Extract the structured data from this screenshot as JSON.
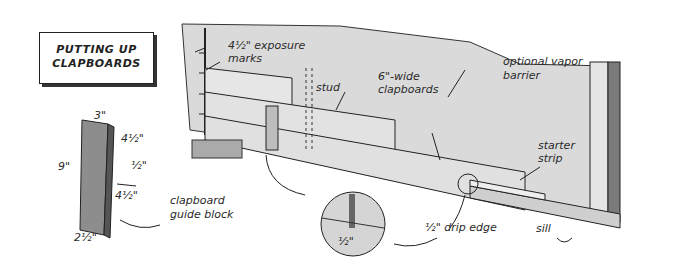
{
  "title": {
    "line1": "PUTTING UP",
    "line2": "CLAPBOARDS"
  },
  "guide_block": {
    "dims": {
      "top": "3\"",
      "upper_right": "4½\"",
      "notch": "½\"",
      "lower_right": "4½\"",
      "left": "9\"",
      "bottom": "2½\""
    }
  },
  "labels": {
    "exposure_marks_line1": "4½\" exposure",
    "exposure_marks_line2": "marks",
    "stud": "stud",
    "clapboards_line1": "6\"-wide",
    "clapboards_line2": "clapboards",
    "vapor_line1": "optional vapor",
    "vapor_line2": "barrier",
    "starter_line1": "starter",
    "starter_line2": "strip",
    "guide_line1": "clapboard",
    "guide_line2": "guide block",
    "drip_edge": "½\" drip edge",
    "detail_dim": "½\"",
    "sill": "sill"
  },
  "colors": {
    "wall": "#d9d9d9",
    "ink": "#222222",
    "wood": "#8a8a8a"
  }
}
